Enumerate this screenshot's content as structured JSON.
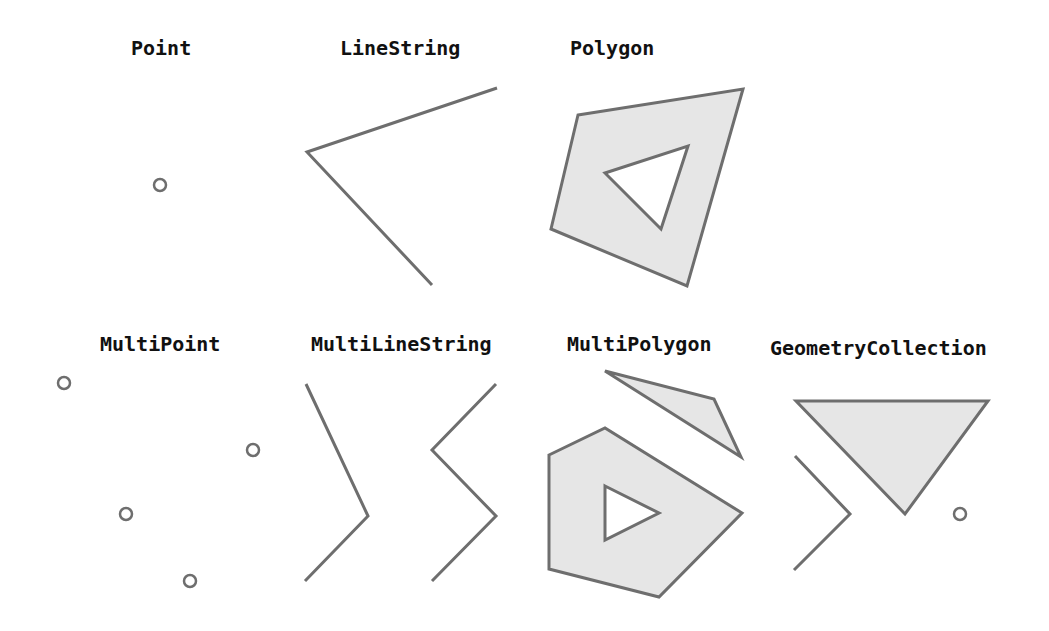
{
  "labels": {
    "point": "Point",
    "linestring": "LineString",
    "polygon": "Polygon",
    "multipoint": "MultiPoint",
    "multilinestring": "MultiLineString",
    "multipolygon": "MultiPolygon",
    "geometrycollection": "GeometryCollection"
  },
  "colors": {
    "stroke": "#6e6e6e",
    "fill": "#e6e6e6",
    "background": "#ffffff",
    "text": "#111111"
  }
}
